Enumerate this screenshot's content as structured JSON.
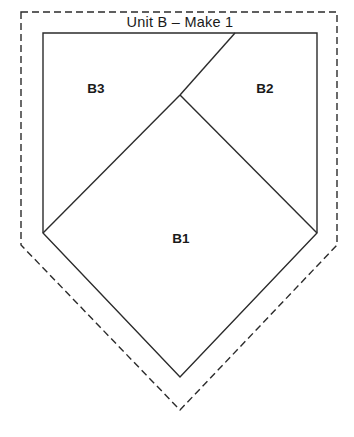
{
  "canvas": {
    "width": 354,
    "height": 437,
    "background": "#ffffff"
  },
  "title": {
    "text": "Unit B – Make 1",
    "x": 180,
    "y": 23
  },
  "style": {
    "solid_stroke_color": "#2b2b2b",
    "solid_stroke_width": 1.4,
    "dashed_stroke_color": "#2b2b2b",
    "dashed_stroke_width": 1.4,
    "dash_pattern": "7 4",
    "fill": "none",
    "label_color": "#1a1a1a"
  },
  "shapes": {
    "seam_allowance_outline": {
      "name": "seam-allowance-outline",
      "kind": "dashed-pentagon",
      "points": "21,12 337,12 337,245 180,410 21,245"
    },
    "finished_unit_outline": {
      "name": "finished-unit-outline",
      "kind": "solid-pentagon",
      "points": "43,33 317,33 317,233 180,377 43,233"
    }
  },
  "seam_lines": [
    {
      "name": "seam-line-b2-b3",
      "from_x": 235,
      "from_y": 33,
      "to_x": 180,
      "to_y": 95
    },
    {
      "name": "seam-line-b1-b3",
      "from_x": 180,
      "from_y": 95,
      "to_x": 43,
      "to_y": 233
    },
    {
      "name": "seam-line-b1-b2",
      "from_x": 180,
      "from_y": 95,
      "to_x": 317,
      "to_y": 233
    }
  ],
  "piece_labels": [
    {
      "name": "piece-label-b3",
      "text": "B3",
      "x": 96,
      "y": 89
    },
    {
      "name": "piece-label-b2",
      "text": "B2",
      "x": 265,
      "y": 89
    },
    {
      "name": "piece-label-b1",
      "text": "B1",
      "x": 181,
      "y": 239
    }
  ]
}
